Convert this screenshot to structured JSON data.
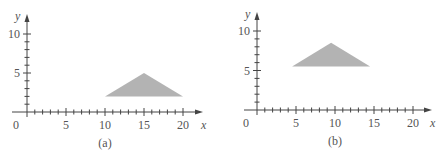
{
  "chart_data": [
    {
      "type": "area",
      "title": "",
      "caption": "(a)",
      "xlabel": "x",
      "ylabel": "y",
      "xlim": [
        0,
        21
      ],
      "ylim": [
        0,
        11
      ],
      "x_ticks": [
        0,
        5,
        10,
        15,
        20
      ],
      "y_ticks": [
        5,
        10
      ],
      "minor_tick_step": 1,
      "grid": false,
      "shape": "triangle",
      "vertices": [
        [
          10,
          2
        ],
        [
          15,
          5
        ],
        [
          20,
          2
        ]
      ],
      "fill": "#b3b3b3"
    },
    {
      "type": "area",
      "title": "",
      "caption": "(b)",
      "xlabel": "x",
      "ylabel": "y",
      "xlim": [
        0,
        21
      ],
      "ylim": [
        0,
        11
      ],
      "x_ticks": [
        0,
        5,
        10,
        15,
        20
      ],
      "y_ticks": [
        5,
        10
      ],
      "minor_tick_step": 1,
      "grid": false,
      "shape": "triangle",
      "vertices": [
        [
          4.5,
          5.5
        ],
        [
          9.5,
          8.5
        ],
        [
          14.5,
          5.5
        ]
      ],
      "fill": "#b3b3b3"
    }
  ],
  "panels": [
    {
      "caption": "(a)",
      "x_label": "x",
      "y_label": "y",
      "x_tick_labels": [
        "0",
        "5",
        "10",
        "15",
        "20"
      ],
      "y_tick_labels": [
        "5",
        "10"
      ]
    },
    {
      "caption": "(b)",
      "x_label": "x",
      "y_label": "y",
      "x_tick_labels": [
        "0",
        "5",
        "10",
        "15",
        "20"
      ],
      "y_tick_labels": [
        "5",
        "10"
      ]
    }
  ]
}
